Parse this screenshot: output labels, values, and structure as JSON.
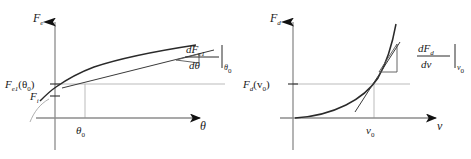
{
  "figure": {
    "background": "#ffffff",
    "axis_color": "#8c8c8c",
    "curve_color": "#1a1a1a",
    "arrow_color": "#111111",
    "guide_color": "#aaaaaa"
  },
  "panels": [
    {
      "id": "elastic-force",
      "y_axis_label": "F",
      "y_axis_label_sub": "e",
      "x_axis_label": "θ",
      "value_label": "F",
      "value_label_sub": "e1",
      "value_label_arg": "(θ",
      "value_label_arg_sub": "0",
      "value_label_arg_end": ")",
      "secondary_label": "F",
      "secondary_label_sub": "i",
      "tick_label": "θ",
      "tick_label_sub": "0",
      "derivative_numerator": "dF",
      "derivative_numerator_sub": "e1",
      "derivative_denominator": "dθ",
      "derivative_eval_sub": "θ",
      "derivative_eval_sub2": "0",
      "curve_shape": "concave-increasing"
    },
    {
      "id": "damping-force",
      "y_axis_label": "F",
      "y_axis_label_sub": "d",
      "x_axis_label": "v",
      "value_label": "F",
      "value_label_sub": "d",
      "value_label_arg": "(v",
      "value_label_arg_sub": "0",
      "value_label_arg_end": ")",
      "tick_label": "v",
      "tick_label_sub": "0",
      "derivative_numerator": "dF",
      "derivative_numerator_sub": "d",
      "derivative_denominator": "dv",
      "derivative_eval_sub": "v",
      "derivative_eval_sub2": "0",
      "curve_shape": "convex-increasing"
    }
  ]
}
